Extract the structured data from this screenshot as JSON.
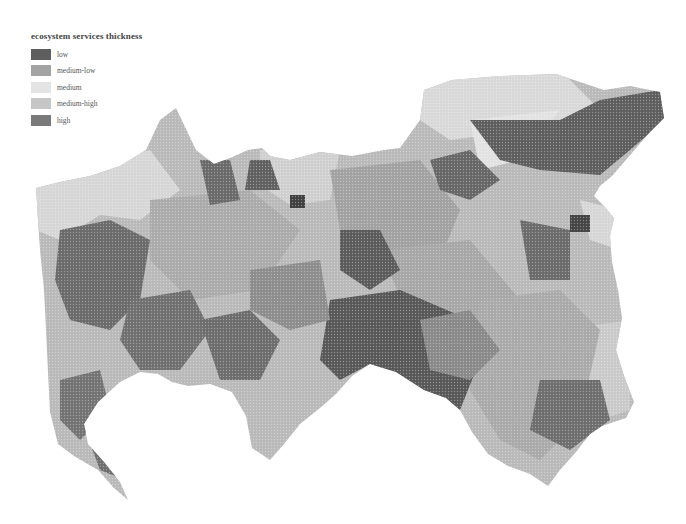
{
  "legend": {
    "title": "ecosystem services thickness",
    "items": [
      {
        "label": "low",
        "color": "#5e5e5e"
      },
      {
        "label": "medium-low",
        "color": "#a3a3a3"
      },
      {
        "label": "medium",
        "color": "#e4e4e4"
      },
      {
        "label": "medium-high",
        "color": "#c6c6c6"
      },
      {
        "label": "high",
        "color": "#7a7a7a"
      }
    ]
  }
}
